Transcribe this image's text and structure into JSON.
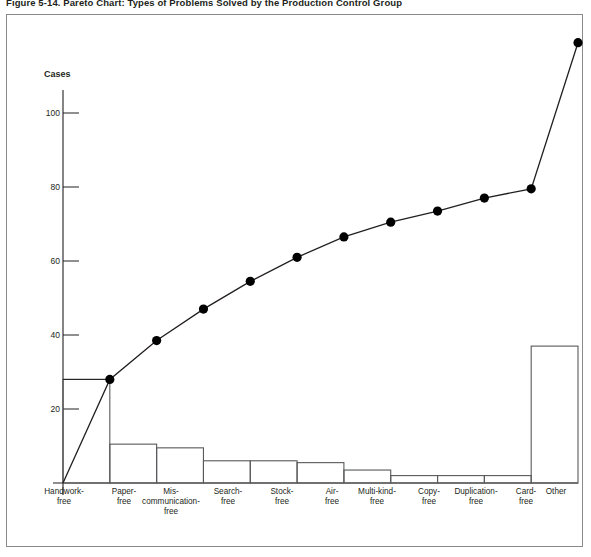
{
  "figure": {
    "title": "Figure 5-14. Pareto Chart: Types of Problems Solved by the Production Control Group"
  },
  "chart_data": {
    "type": "bar",
    "title": "Figure 5-14. Pareto Chart: Types of Problems Solved by the Production Control Group",
    "xlabel": "",
    "ylabel": "Cases",
    "ylim": [
      0,
      120
    ],
    "grid": false,
    "legend": "none",
    "yticks": [
      20,
      40,
      60,
      80,
      100
    ],
    "ytick_labels": [
      "20",
      "40",
      "60",
      "80",
      "100"
    ],
    "categories": [
      "Handwork-free",
      "Paper-free",
      "Mis-communication-free",
      "Search-free",
      "Stock-free",
      "Air-free",
      "Multi-kind-free",
      "Copy-free",
      "Duplication-free",
      "Card-free",
      "Other"
    ],
    "category_lines": [
      [
        "Handwork-",
        "free"
      ],
      [
        "Paper-",
        "free"
      ],
      [
        "Mis-",
        "communication-",
        "free"
      ],
      [
        "Search-",
        "free"
      ],
      [
        "Stock-",
        "free"
      ],
      [
        "Air-",
        "free"
      ],
      [
        "Multi-kind-",
        "free"
      ],
      [
        "Copy-",
        "free"
      ],
      [
        "Duplication-",
        "free"
      ],
      [
        "Card-",
        "free"
      ],
      [
        "Other"
      ]
    ],
    "values": [
      28,
      10.5,
      9.5,
      6,
      6,
      5.5,
      3.5,
      2,
      2,
      2,
      37
    ],
    "cumulative": [
      28,
      38.5,
      48,
      54,
      60,
      65.5,
      69,
      71,
      73,
      75,
      112
    ],
    "cumulative_points": [
      28,
      38.5,
      47,
      54.5,
      61,
      66.5,
      70.5,
      73.5,
      77,
      79.5,
      119
    ],
    "series": [
      {
        "name": "Cases",
        "type": "bar",
        "values": [
          28,
          10.5,
          9.5,
          6,
          6,
          5.5,
          3.5,
          2,
          2,
          2,
          37
        ]
      },
      {
        "name": "Cumulative",
        "type": "line",
        "values": [
          28,
          38.5,
          47,
          54.5,
          61,
          66.5,
          70.5,
          73.5,
          77,
          79.5,
          119
        ]
      }
    ],
    "annotations": {
      "reference_line_value": 28,
      "reference_line_note": "horizontal line from y-axis to first cumulative point"
    },
    "colors": {
      "bar_stroke": "#58595b",
      "line": "#231f20",
      "marker": "#000000",
      "axis": "#231f20",
      "frame": "#8a8a8a",
      "text": "#231f20"
    }
  }
}
